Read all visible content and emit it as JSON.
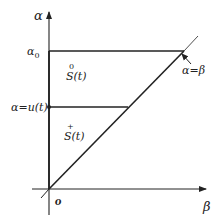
{
  "diagram": {
    "axes": {
      "y_label": "α",
      "x_label": "β",
      "origin_label": "o"
    },
    "levels": {
      "top_label": "α",
      "top_subscript": "0",
      "middle_label": "α=u(t)"
    },
    "regions": [
      {
        "name": "S",
        "superscript": "0",
        "suffix": "(t)"
      },
      {
        "name": "S",
        "superscript": "+",
        "suffix": "(t)"
      }
    ],
    "diagonal_label": "α=β",
    "colors": {
      "line": "#222222",
      "text": "#222222"
    }
  }
}
